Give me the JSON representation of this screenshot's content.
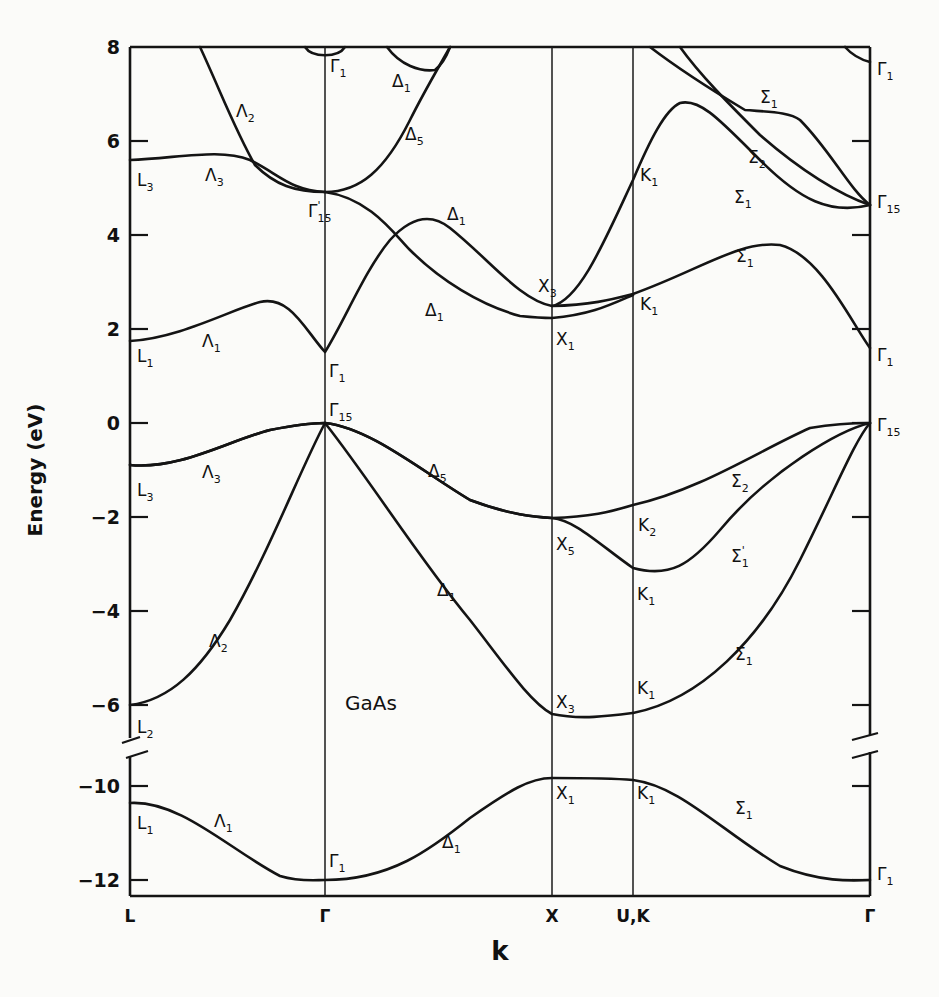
{
  "chart_data": {
    "type": "line",
    "title": "GaAs",
    "xlabel": "k",
    "ylabel": "Energy (eV)",
    "x_ticks": [
      {
        "label": "L",
        "x": 130
      },
      {
        "label": "Γ",
        "x": 325
      },
      {
        "label": "X",
        "x": 552
      },
      {
        "label": "U,K",
        "x": 633
      },
      {
        "label": "Γ",
        "x": 870
      }
    ],
    "y_ticks_upper": [
      {
        "label": "8",
        "value": 8,
        "y": 47
      },
      {
        "label": "6",
        "value": 6,
        "y": 141
      },
      {
        "label": "4",
        "value": 4,
        "y": 235
      },
      {
        "label": "2",
        "value": 2,
        "y": 329
      },
      {
        "label": "0",
        "value": 0,
        "y": 423
      },
      {
        "label": "−2",
        "value": -2,
        "y": 517
      },
      {
        "label": "−4",
        "value": -4,
        "y": 611
      },
      {
        "label": "−6",
        "value": -6,
        "y": 705
      }
    ],
    "y_ticks_lower": [
      {
        "label": "−10",
        "value": -10,
        "y": 786
      },
      {
        "label": "−12",
        "value": -12,
        "y": 880
      }
    ],
    "ylim": [
      -12.3,
      8
    ],
    "axis_break": [
      -6.7,
      -9.3
    ],
    "grid": false,
    "legend": null,
    "high_symmetry_energies_eV": {
      "L": {
        "L1_lower": -10.4,
        "L2": -6.0,
        "L3_valence": -0.9,
        "L1_conduction": 1.8,
        "L3_conduction": 5.6
      },
      "Gamma": {
        "Gamma1_lower": -12.0,
        "Gamma15_valence": 0.0,
        "Gamma1_conduction": 1.5,
        "Gamma15_conduction": 4.8,
        "Gamma1_upper": 8.0
      },
      "X": {
        "X1_lower": -9.4,
        "X3_valence": -6.3,
        "X5": -2.1,
        "X1_conduction": 2.2,
        "X3_conduction": 2.6
      },
      "K": {
        "K1_lower": -9.5,
        "K1_valence": -6.2,
        "K1_mid": -3.2,
        "K2": -2.0,
        "K1_conduction": 2.2,
        "K1_upper": 5.4
      },
      "Gamma_right": {
        "Gamma1_lower": -12.0,
        "Gamma15_valence": 0.0,
        "Gamma1_conduction": 1.6,
        "Gamma15_conduction": 4.8,
        "Gamma1_upper": 7.6
      }
    },
    "bands": [
      {
        "name": "lowest valence (Λ1/Δ1/Σ1)",
        "d": "M130,803 C180,800 230,850 280,876 C300,882 315,880 325,880 C390,880 430,850 470,818 C510,790 530,778 552,778 C590,778 610,778 633,780 C680,786 720,830 780,866 C820,882 850,881 870,880"
      },
      {
        "name": "valence band 2 (Λ2/Δ1/Σ1)",
        "d": "M130,705 C170,700 200,670 230,620 C270,550 300,470 325,423 C370,480 420,560 470,620 C505,665 530,702 552,714 C580,720 610,716 633,713 C700,700 760,640 800,560 C835,490 855,440 870,423"
      },
      {
        "name": "valence band 3 (Λ3/Δ5/Σ1')",
        "d": "M130,465 C180,470 230,440 270,430 C300,424 315,423 325,423 C370,428 420,470 470,500 C510,515 535,517 552,518 C575,520 600,545 633,568 C670,578 690,565 720,530 C770,470 840,430 870,423"
      },
      {
        "name": "valence band 4 (Λ3/Δ5/Σ2)",
        "d": "M130,465 C180,470 230,440 270,430 C300,424 315,423 325,423 C370,428 420,470 470,500 C510,515 535,517 552,518 C590,517 610,512 633,505 C700,490 760,450 810,428 C840,423 860,423 870,423"
      },
      {
        "name": "lowest conduction (Λ1/Δ1/Σ1)",
        "d": "M130,341 C180,338 230,310 260,302 C290,295 305,330 325,352 C345,320 365,270 390,240 C410,218 430,212 450,228 C490,260 520,300 552,306 C590,305 610,300 633,294 C700,270 740,240 780,245 C820,255 850,320 870,348"
      },
      {
        "name": "conduction Δ1 crossing (to X1)",
        "d": "M325,192 C370,198 395,235 410,250 C440,280 480,305 520,316 C540,318 550,318 552,318 C590,315 610,305 633,295"
      },
      {
        "name": "conduction band upward (X3 to K1 peak)",
        "d": "M552,306 C580,300 605,240 633,180 C650,140 665,110 680,103 C700,98 720,120 760,160 C800,200 830,215 870,205"
      },
      {
        "name": "conduction Λ3 / Γ15'",
        "d": "M130,160 C180,158 220,148 250,160 C280,175 290,190 325,192"
      },
      {
        "name": "conduction Λ2 down to Γ15'",
        "d": "M200,47 C220,90 235,130 255,165 C275,185 295,192 325,192 C360,192 385,170 410,120 C425,90 440,65 450,47"
      },
      {
        "name": "conduction Δ1 arc near top",
        "d": "M387,47 C400,65 420,72 435,70 C445,62 448,52 450,47"
      },
      {
        "name": "Γ1 upper arc (left)",
        "d": "M305,47 C312,58 338,58 345,47"
      },
      {
        "name": "Σ upper bands",
        "d": "M650,47 C680,70 720,95 745,110 C770,112 790,112 800,120 C830,150 850,190 870,205"
      },
      {
        "name": "Σ2 upper",
        "d": "M680,47 C700,75 730,105 760,135 C800,170 840,195 870,205"
      },
      {
        "name": "Γ1 upper arc (right)",
        "d": "M845,47 C853,56 862,60 870,62"
      }
    ],
    "point_labels": [
      {
        "text": "Γ",
        "sub": "1",
        "x": 330,
        "y": 72
      },
      {
        "text": "Δ",
        "sub": "1",
        "x": 392,
        "y": 87
      },
      {
        "text": "Λ",
        "sub": "2",
        "x": 236,
        "y": 117
      },
      {
        "text": "Δ",
        "sub": "5",
        "x": 405,
        "y": 140
      },
      {
        "text": "L",
        "sub": "3",
        "x": 137,
        "y": 186
      },
      {
        "text": "Λ",
        "sub": "3",
        "x": 205,
        "y": 181
      },
      {
        "text": "Γ",
        "sub": "15",
        "sup": "'",
        "x": 308,
        "y": 217
      },
      {
        "text": "Δ",
        "sub": "1",
        "x": 447,
        "y": 220
      },
      {
        "text": "X",
        "sub": "3",
        "x": 538,
        "y": 292
      },
      {
        "text": "Δ",
        "sub": "1",
        "x": 425,
        "y": 316
      },
      {
        "text": "K",
        "sub": "1",
        "x": 640,
        "y": 181
      },
      {
        "text": "K",
        "sub": "1",
        "x": 640,
        "y": 310
      },
      {
        "text": "X",
        "sub": "1",
        "x": 556,
        "y": 345
      },
      {
        "text": "Λ",
        "sub": "1",
        "x": 202,
        "y": 347
      },
      {
        "text": "L",
        "sub": "1",
        "x": 137,
        "y": 362
      },
      {
        "text": "Γ",
        "sub": "1",
        "x": 329,
        "y": 377
      },
      {
        "text": "Γ",
        "sub": "15",
        "x": 329,
        "y": 416
      },
      {
        "text": "Σ",
        "sub": "1",
        "x": 760,
        "y": 103
      },
      {
        "text": "Σ",
        "sub": "2",
        "x": 748,
        "y": 163
      },
      {
        "text": "Σ",
        "sub": "1",
        "x": 734,
        "y": 203
      },
      {
        "text": "Σ",
        "sub": "1",
        "x": 736,
        "y": 262
      },
      {
        "text": "Γ",
        "sub": "1",
        "x": 877,
        "y": 75
      },
      {
        "text": "Γ",
        "sub": "15",
        "x": 877,
        "y": 208
      },
      {
        "text": "Γ",
        "sub": "1",
        "x": 877,
        "y": 361
      },
      {
        "text": "Γ",
        "sub": "15",
        "x": 877,
        "y": 431
      },
      {
        "text": "Λ",
        "sub": "3",
        "x": 202,
        "y": 478
      },
      {
        "text": "L",
        "sub": "3",
        "x": 137,
        "y": 496
      },
      {
        "text": "Δ",
        "sub": "5",
        "x": 428,
        "y": 477
      },
      {
        "text": "Σ",
        "sub": "2",
        "x": 731,
        "y": 487
      },
      {
        "text": "X",
        "sub": "5",
        "x": 556,
        "y": 550
      },
      {
        "text": "K",
        "sub": "2",
        "x": 638,
        "y": 531
      },
      {
        "text": "Σ",
        "sub": "1",
        "sup": "'",
        "x": 731,
        "y": 562
      },
      {
        "text": "Δ",
        "sub": "1",
        "x": 437,
        "y": 596
      },
      {
        "text": "K",
        "sub": "1",
        "x": 637,
        "y": 600
      },
      {
        "text": "Λ",
        "sub": "2",
        "x": 209,
        "y": 647
      },
      {
        "text": "Σ",
        "sub": "1",
        "x": 735,
        "y": 660
      },
      {
        "text": "K",
        "sub": "1",
        "x": 637,
        "y": 694
      },
      {
        "text": "X",
        "sub": "3",
        "x": 556,
        "y": 708
      },
      {
        "text": "L",
        "sub": "2",
        "x": 137,
        "y": 733
      },
      {
        "text": "X",
        "sub": "1",
        "x": 556,
        "y": 799
      },
      {
        "text": "K",
        "sub": "1",
        "x": 637,
        "y": 799
      },
      {
        "text": "Σ",
        "sub": "1",
        "x": 735,
        "y": 814
      },
      {
        "text": "L",
        "sub": "1",
        "x": 137,
        "y": 829
      },
      {
        "text": "Λ",
        "sub": "1",
        "x": 214,
        "y": 827
      },
      {
        "text": "Δ",
        "sub": "1",
        "x": 442,
        "y": 848
      },
      {
        "text": "Γ",
        "sub": "1",
        "x": 329,
        "y": 867
      },
      {
        "text": "Γ",
        "sub": "1",
        "x": 877,
        "y": 880
      }
    ],
    "annotation": {
      "text": "GaAs",
      "x": 345,
      "y": 710
    }
  }
}
